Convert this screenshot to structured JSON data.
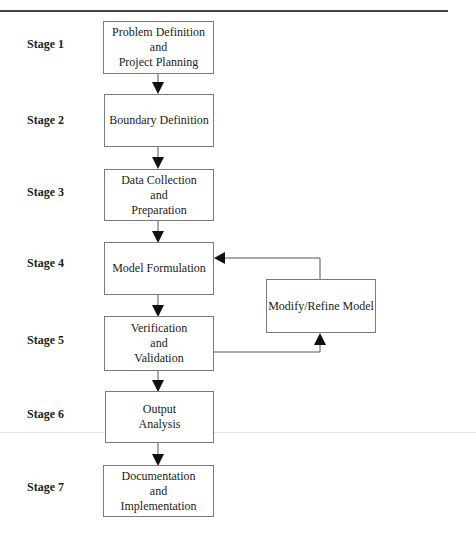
{
  "diagram": {
    "type": "flowchart",
    "stages": [
      {
        "label": "Stage 1",
        "box_lines": [
          "Problem Definition",
          "and",
          "Project Planning"
        ]
      },
      {
        "label": "Stage 2",
        "box_lines": [
          "Boundary Definition"
        ]
      },
      {
        "label": "Stage 3",
        "box_lines": [
          "Data Collection",
          "and",
          "Preparation"
        ]
      },
      {
        "label": "Stage 4",
        "box_lines": [
          "Model Formulation"
        ]
      },
      {
        "label": "Stage 5",
        "box_lines": [
          "Verification",
          "and",
          "Validation"
        ]
      },
      {
        "label": "Stage 6",
        "box_lines": [
          "Output",
          "Analysis"
        ]
      },
      {
        "label": "Stage 7",
        "box_lines": [
          "Documentation",
          "and",
          "Implementation"
        ]
      }
    ],
    "feedback_box": {
      "label": "Modify/Refine Model"
    },
    "edges": [
      {
        "from": "Stage 1",
        "to": "Stage 2"
      },
      {
        "from": "Stage 2",
        "to": "Stage 3"
      },
      {
        "from": "Stage 3",
        "to": "Stage 4"
      },
      {
        "from": "Stage 4",
        "to": "Stage 5"
      },
      {
        "from": "Stage 5",
        "to": "Modify/Refine Model"
      },
      {
        "from": "Modify/Refine Model",
        "to": "Stage 4"
      },
      {
        "from": "Stage 5",
        "to": "Stage 6"
      },
      {
        "from": "Stage 6",
        "to": "Stage 7"
      }
    ],
    "colors": {
      "line": "#555555",
      "box_border": "#7a7a7a",
      "text": "#222222"
    }
  }
}
